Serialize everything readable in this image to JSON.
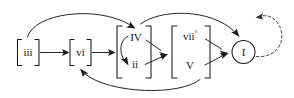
{
  "diagram": {
    "background_color": "#ffffff",
    "line_color": "#1a1a1a",
    "nodes": [
      {
        "id": "iii",
        "label": "iii",
        "superscript": "",
        "shape": "bracket",
        "x": 28,
        "y": 52
      },
      {
        "id": "vi",
        "label": "vi",
        "superscript": "",
        "shape": "bracket",
        "x": 80,
        "y": 52
      },
      {
        "id": "IV",
        "label": "IV",
        "superscript": "",
        "shape": "bracket-group-top",
        "x": 136,
        "y": 38
      },
      {
        "id": "ii",
        "label": "ii",
        "superscript": "",
        "shape": "bracket-group-bottom",
        "x": 136,
        "y": 64
      },
      {
        "id": "viio",
        "label": "vii",
        "superscript": "°",
        "shape": "bracket-group-top",
        "x": 192,
        "y": 36
      },
      {
        "id": "V",
        "label": "V",
        "superscript": "",
        "shape": "bracket-group-bottom",
        "x": 192,
        "y": 64
      },
      {
        "id": "I",
        "label": "I",
        "superscript": "",
        "shape": "circle",
        "x": 243,
        "y": 52
      }
    ],
    "edges": [
      {
        "from": "iii",
        "to": "vi",
        "style": "solid",
        "path": "straight"
      },
      {
        "from": "vi",
        "to": "IV-ii-group",
        "style": "solid",
        "path": "straight"
      },
      {
        "from": "iii",
        "to": "IV",
        "style": "solid",
        "path": "arc-over"
      },
      {
        "from": "IV",
        "to": "ii",
        "style": "solid",
        "path": "arc-internal"
      },
      {
        "from": "IV",
        "to": "viio-V-group",
        "style": "solid",
        "path": "straight"
      },
      {
        "from": "ii",
        "to": "viio-V-group",
        "style": "solid",
        "path": "straight"
      },
      {
        "from": "IV-ii-group",
        "to": "I",
        "style": "solid",
        "path": "arc-over"
      },
      {
        "from": "viio",
        "to": "I",
        "style": "solid",
        "path": "straight"
      },
      {
        "from": "V",
        "to": "I",
        "style": "solid",
        "path": "straight"
      },
      {
        "from": "viio-V-group",
        "to": "vi",
        "style": "solid",
        "path": "arc-under"
      },
      {
        "from": "I",
        "to": "I",
        "style": "dashed",
        "path": "self-loop-right"
      }
    ]
  }
}
